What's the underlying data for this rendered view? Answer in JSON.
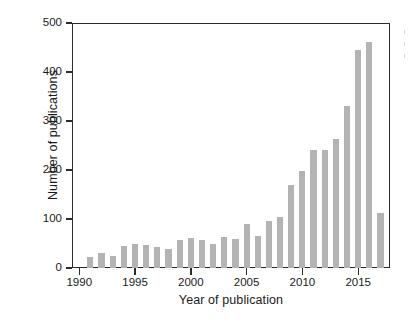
{
  "chart_data": {
    "type": "bar",
    "title": "",
    "xlabel": "Year of publication",
    "ylabel": "Number of publications",
    "xlim": [
      1989.4,
      1989.4
    ],
    "ylim": [
      0,
      500
    ],
    "grid": false,
    "legend": null,
    "bar_color": "#b3b3b3",
    "axis_color": "#2b2b2b",
    "xticks": [
      1990,
      1995,
      2000,
      2005,
      2010,
      2015
    ],
    "xtick_labels": [
      "1990",
      "1995",
      "2000",
      "2005",
      "2010",
      "2015"
    ],
    "yticks": [
      0,
      100,
      200,
      300,
      400,
      500
    ],
    "ytick_labels": [
      "0",
      "100",
      "200",
      "300",
      "400",
      "500"
    ],
    "categories": [
      1991,
      1992,
      1993,
      1994,
      1995,
      1996,
      1997,
      1998,
      1999,
      2000,
      2001,
      2002,
      2003,
      2004,
      2005,
      2006,
      2007,
      2008,
      2009,
      2010,
      2011,
      2012,
      2013,
      2014,
      2015,
      2016,
      2017
    ],
    "values": [
      22,
      30,
      25,
      45,
      48,
      47,
      43,
      39,
      58,
      62,
      58,
      48,
      63,
      60,
      90,
      66,
      95,
      104,
      170,
      199,
      241,
      241,
      264,
      331,
      444,
      461,
      113
    ]
  }
}
